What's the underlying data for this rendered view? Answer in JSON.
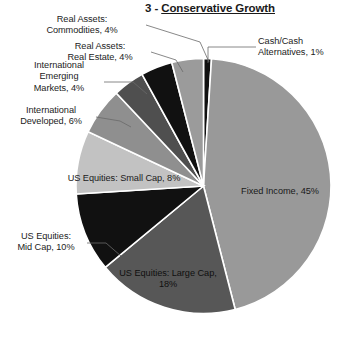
{
  "title": {
    "number": "3 - ",
    "name": "Conservative Growth",
    "full": "3 - Conservative Growth"
  },
  "chart_data": {
    "type": "pie",
    "title": "3 - Conservative Growth",
    "xlabel": "",
    "ylabel": "",
    "legend": "none",
    "grid": false,
    "start_angle_deg": 0,
    "direction": "clockwise",
    "categories": [
      "Cash/Cash Alternatives",
      "Fixed Income",
      "US Equities: Large Cap",
      "US Equities: Mid Cap",
      "US Equities: Small Cap",
      "International Developed",
      "International Emerging Markets",
      "Real Assets: Real Estate",
      "Real Assets: Commodities"
    ],
    "values": [
      1,
      45,
      18,
      10,
      8,
      6,
      4,
      4,
      4
    ],
    "units": "%",
    "colors": [
      "#111111",
      "#999999",
      "#575757",
      "#111111",
      "#c2c2c2",
      "#8f8f8f",
      "#4f4f4f",
      "#111111",
      "#9b9b9b"
    ],
    "slices": [
      {
        "label": "Cash/Cash Alternatives, 1%",
        "name": "Cash/Cash Alternatives",
        "value": 1,
        "color": "#111111",
        "label_text": "Cash/Cash\nAlternatives, 1%",
        "label_placement": "outside-right"
      },
      {
        "label": "Fixed Income, 45%",
        "name": "Fixed Income",
        "value": 45,
        "color": "#999999",
        "label_text": "Fixed Income, 45%",
        "label_placement": "inside"
      },
      {
        "label": "US Equities: Large Cap, 18%",
        "name": "US Equities: Large Cap",
        "value": 18,
        "color": "#575757",
        "label_text": "US Equities: Large Cap,\n18%",
        "label_placement": "inside"
      },
      {
        "label": "US Equities: Mid Cap, 10%",
        "name": "US Equities: Mid Cap",
        "value": 10,
        "color": "#111111",
        "label_text": "US Equities:\nMid Cap, 10%",
        "label_placement": "outside-left"
      },
      {
        "label": "US Equities: Small Cap, 8%",
        "name": "US Equities: Small Cap",
        "value": 8,
        "color": "#c2c2c2",
        "label_text": "US Equities: Small Cap, 8%",
        "label_placement": "inside"
      },
      {
        "label": "International Developed, 6%",
        "name": "International Developed",
        "value": 6,
        "color": "#8f8f8f",
        "label_text": "International\nDeveloped, 6%",
        "label_placement": "outside-left"
      },
      {
        "label": "International Emerging Markets, 4%",
        "name": "International Emerging Markets",
        "value": 4,
        "color": "#4f4f4f",
        "label_text": "International\nEmerging\nMarkets, 4%",
        "label_placement": "outside-left"
      },
      {
        "label": "Real Assets: Real Estate, 4%",
        "name": "Real Assets: Real Estate",
        "value": 4,
        "color": "#111111",
        "label_text": "Real Assets:\nReal Estate, 4%",
        "label_placement": "outside-left"
      },
      {
        "label": "Real Assets: Commodities, 4%",
        "name": "Real Assets: Commodities",
        "value": 4,
        "color": "#9b9b9b",
        "label_text": "Real Assets:\nCommodities, 4%",
        "label_placement": "outside-left"
      }
    ]
  },
  "labels": {
    "commodities": "Real Assets:\nCommodities, 4%",
    "real_estate": "Real Assets:\nReal Estate, 4%",
    "emerging": "International\nEmerging\nMarkets, 4%",
    "developed": "International\nDeveloped, 6%",
    "mid_cap": "US Equities:\nMid Cap, 10%",
    "small_cap": "US Equities: Small Cap, 8%",
    "large_cap": "US Equities: Large Cap,\n18%",
    "fixed_income": "Fixed Income, 45%",
    "cash": "Cash/Cash\nAlternatives, 1%"
  }
}
